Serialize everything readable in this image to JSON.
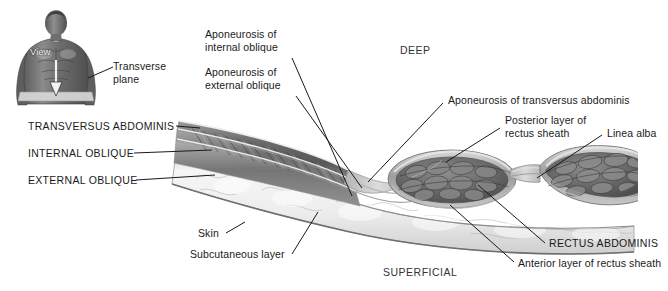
{
  "figure": {
    "background_color": "#ffffff",
    "text_color": "#1a1a1a"
  },
  "orientation_inset": {
    "name": "anatomical-orientation-figure",
    "view_label": "View",
    "plane_label_line1": "Transverse",
    "plane_label_line2": "plane",
    "body_tone": "#6e6e6e",
    "plane_band_color": "#d8d8d8"
  },
  "orientation_terms": {
    "deep": "DEEP",
    "superficial": "SUPERFICIAL"
  },
  "labels": {
    "aponeurosis_internal_oblique_l1": "Aponeurosis of",
    "aponeurosis_internal_oblique_l2": "internal oblique",
    "aponeurosis_external_oblique_l1": "Aponeurosis of",
    "aponeurosis_external_oblique_l2": "external oblique",
    "aponeurosis_transversus_abdominis": "Aponeurosis of transversus abdominis",
    "posterior_layer_rectus_sheath_l1": "Posterior layer of",
    "posterior_layer_rectus_sheath_l2": "rectus sheath",
    "linea_alba": "Linea alba",
    "transversus_abdominis": "TRANSVERSUS ABDOMINIS",
    "internal_oblique": "INTERNAL OBLIQUE",
    "external_oblique": "EXTERNAL OBLIQUE",
    "skin": "Skin",
    "subcutaneous_layer": "Subcutaneous layer",
    "rectus_abdominis": "RECTUS ABDOMINIS",
    "anterior_layer_rectus_sheath": "Anterior layer of rectus sheath"
  },
  "palette": {
    "muscle_dark": "#4a4a4a",
    "muscle_mid": "#7d7d7d",
    "muscle_light": "#a8a8a8",
    "fascia": "#e6e6e6",
    "subcutaneous": "#ededed",
    "skin_line": "#8f8f8f",
    "leader_line": "#1a1a1a"
  }
}
